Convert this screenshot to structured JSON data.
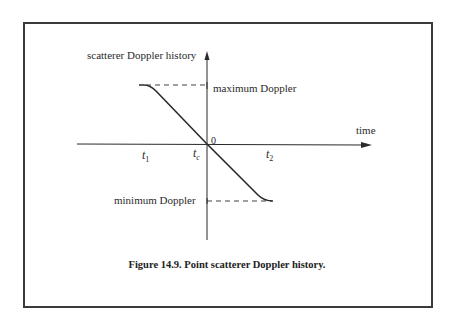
{
  "figure": {
    "caption": "Figure 14.9. Point scatterer Doppler history.",
    "y_axis_label": "scatterer Doppler history",
    "x_axis_label": "time",
    "origin_label": "0",
    "max_label": "maximum Doppler",
    "min_label": "minimum Doppler",
    "ticks": {
      "t1": {
        "base": "t",
        "sub": "1"
      },
      "tc": {
        "base": "t",
        "sub": "c"
      },
      "t2": {
        "base": "t",
        "sub": "2"
      }
    },
    "colors": {
      "line": "#2a2a2a",
      "frame": "#3a3a3a"
    }
  }
}
